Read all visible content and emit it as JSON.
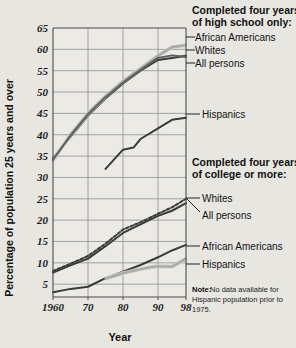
{
  "chart_data": {
    "type": "line",
    "title": "",
    "xlabel": "Year",
    "ylabel": "Percentage of population 25 years and over",
    "xlim": [
      1960,
      1998
    ],
    "ylim": [
      2,
      65
    ],
    "grid": true,
    "xticks": [
      "1960",
      "70",
      "80",
      "90",
      "98"
    ],
    "xtick_values": [
      1960,
      1970,
      1980,
      1990,
      1998
    ],
    "yticks": [
      "5",
      "10",
      "15",
      "20",
      "25",
      "30",
      "35",
      "40",
      "45",
      "50",
      "55",
      "60",
      "65"
    ],
    "ytick_values": [
      5,
      10,
      15,
      20,
      25,
      30,
      35,
      40,
      45,
      50,
      55,
      60,
      65
    ],
    "legend_position": "right",
    "annotations": [
      "Note: No data available for Hispanic population prior to 1975."
    ],
    "groups": [
      {
        "heading_line1": "Completed four years",
        "heading_line2": "of high school only:",
        "series": [
          {
            "name": "African Americans",
            "style": "solid-dark",
            "x": [
              1960,
              1965,
              1970,
              1975,
              1980,
              1985,
              1990,
              1994,
              1998
            ],
            "values": [
              34.5,
              39.5,
              44.5,
              48.5,
              52.0,
              55.0,
              57.5,
              58.0,
              58.5
            ]
          },
          {
            "name": "Whites",
            "style": "solid-gray",
            "x": [
              1960,
              1965,
              1970,
              1975,
              1980,
              1985,
              1990,
              1994,
              1998
            ],
            "values": [
              34.0,
              40.0,
              45.0,
              49.0,
              52.5,
              55.5,
              58.5,
              60.5,
              61.0
            ]
          },
          {
            "name": "All persons",
            "style": "solid-medium",
            "x": [
              1960,
              1965,
              1970,
              1975,
              1980,
              1985,
              1990,
              1994,
              1998
            ],
            "values": [
              34.2,
              39.8,
              44.8,
              48.8,
              52.2,
              55.2,
              58.0,
              58.6,
              58.2
            ]
          },
          {
            "name": "Hispanics",
            "style": "solid-dark",
            "x": [
              1975,
              1980,
              1983,
              1985,
              1990,
              1994,
              1998
            ],
            "values": [
              32.0,
              36.5,
              37.0,
              39.0,
              41.5,
              43.5,
              44.0
            ]
          }
        ]
      },
      {
        "heading_line1": "Completed four years",
        "heading_line2": "of college or more:",
        "series": [
          {
            "name": "Whites",
            "style": "dashed-dark",
            "x": [
              1960,
              1965,
              1970,
              1975,
              1980,
              1985,
              1990,
              1994,
              1998
            ],
            "values": [
              8.1,
              9.8,
              11.6,
              14.5,
              17.8,
              19.5,
              21.5,
              23.0,
              25.0
            ]
          },
          {
            "name": "All persons",
            "style": "solid-dark",
            "x": [
              1960,
              1965,
              1970,
              1975,
              1980,
              1985,
              1990,
              1994,
              1998
            ],
            "values": [
              7.7,
              9.4,
              11.0,
              13.9,
              17.0,
              19.0,
              21.0,
              22.2,
              24.0
            ]
          },
          {
            "name": "African Americans",
            "style": "solid-dark",
            "x": [
              1960,
              1965,
              1970,
              1975,
              1980,
              1985,
              1990,
              1994,
              1998
            ],
            "values": [
              3.1,
              3.9,
              4.4,
              6.4,
              7.9,
              9.5,
              11.3,
              12.9,
              14.2
            ]
          },
          {
            "name": "Hispanics",
            "style": "solid-gray",
            "x": [
              1975,
              1980,
              1985,
              1988,
              1990,
              1994,
              1998
            ],
            "values": [
              6.3,
              7.6,
              8.5,
              9.0,
              9.2,
              9.1,
              11.0
            ]
          }
        ]
      }
    ]
  },
  "legend": {
    "hs": {
      "heading_line1": "Completed four years",
      "heading_line2": "of high school only:",
      "items": [
        "African Americans",
        "Whites",
        "All persons",
        "Hispanics"
      ]
    },
    "college": {
      "heading_line1": "Completed four years",
      "heading_line2": "of college or more:",
      "items": [
        "Whites",
        "All persons",
        "African Americans",
        "Hispanics"
      ]
    }
  },
  "note": {
    "label": "Note:",
    "text": "No data available for Hispanic population prior to 1975."
  },
  "axes": {
    "ylabel": "Percentage of population 25 years and over",
    "xlabel": "Year"
  },
  "colors": {
    "background": "#e8e6e1",
    "plot_background": "#eceae5",
    "grid": "#8f8f93",
    "frame": "#4a4a4a",
    "line_dark": "#3a3a3a",
    "line_medium": "#5d5d5d",
    "line_light": "#a9a9a9",
    "text": "#111111"
  }
}
